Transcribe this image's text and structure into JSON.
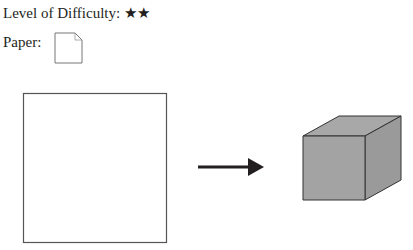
{
  "header": {
    "difficulty_label": "Level of Difficulty:",
    "difficulty_stars": "★★",
    "paper_label": "Paper:"
  },
  "diagram": {
    "paper_icon": "folded-corner-paper-icon",
    "start_shape": "square",
    "arrow": "right-arrow",
    "end_shape": "cube",
    "cube_fill": "#a0a0a0",
    "stroke": "#333333"
  }
}
